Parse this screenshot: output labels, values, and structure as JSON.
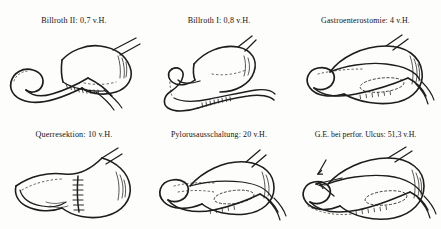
{
  "plate": {
    "title": "Gastric surgery procedures mortality plate",
    "unit_note": "v.H.",
    "ink_color": "#1a1a1a",
    "background_color": "#fdfdfc"
  },
  "figures": [
    {
      "id": "billroth-2",
      "caption": "Billroth II: 0,7 v.H.",
      "procedure": "Billroth II",
      "value": "0,7",
      "unit": "v.H."
    },
    {
      "id": "billroth-1",
      "caption": "Billroth I: 0,8 v.H.",
      "procedure": "Billroth I",
      "value": "0,8",
      "unit": "v.H."
    },
    {
      "id": "gastroenterostomie",
      "caption": "Gastroenterostomie: 4 v.H.",
      "procedure": "Gastroenterostomie",
      "value": "4",
      "unit": "v.H."
    },
    {
      "id": "querresektion",
      "caption": "Querresektion: 10 v.H.",
      "procedure": "Querresektion",
      "value": "10",
      "unit": "v.H."
    },
    {
      "id": "pylorusausschaltung",
      "caption": "Pylorusausschaltung: 20 v.H.",
      "procedure": "Pylorusausschaltung",
      "value": "20",
      "unit": "v.H."
    },
    {
      "id": "ge-bei-perfor-ulcus",
      "caption": "G.E. bei perfor. Ulcus: 51,3 v.H.",
      "procedure": "G.E. bei perfor. Ulcus",
      "value": "51,3",
      "unit": "v.H."
    }
  ]
}
